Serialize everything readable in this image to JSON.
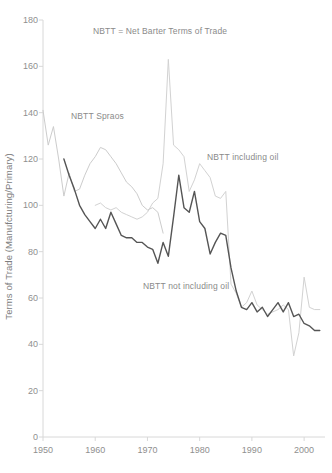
{
  "chart_data": {
    "type": "line",
    "title": "",
    "note": "NBTT = Net Barter Terms of Trade",
    "xlabel": "",
    "ylabel": "Terms of Trade (Manufcturing/Primary)",
    "xlim": [
      1950,
      2004
    ],
    "ylim": [
      0,
      180
    ],
    "grid": false,
    "legend_position": "inline-annotations",
    "y_ticks": [
      0,
      20,
      40,
      60,
      80,
      100,
      120,
      140,
      160,
      180
    ],
    "x_ticks": [
      1950,
      1960,
      1970,
      1980,
      1990,
      2000
    ],
    "y_tick_labels": [
      "0",
      "20",
      "40",
      "60",
      "80",
      "100",
      "120",
      "140",
      "160",
      "180"
    ],
    "x_tick_labels": [
      "1950",
      "1960",
      "1970",
      "1980",
      "1990",
      "2000"
    ],
    "annotations": [
      {
        "text": "NBTT = Net Barter Terms of Trade",
        "x": 1972,
        "y": 172
      },
      {
        "text": "NBTT Spraos",
        "x": 1956,
        "y": 129
      },
      {
        "text": "NBTT including oil",
        "x": 1985,
        "y": 113
      },
      {
        "text": "NBTT not including oil",
        "x": 1978,
        "y": 65
      }
    ],
    "series": [
      {
        "name": "NBTT Spraos",
        "color": "#cccccc",
        "width": 1.0,
        "x": [
          1950,
          1951,
          1952,
          1953,
          1954,
          1955,
          1956,
          1957,
          1958,
          1959,
          1960,
          1961,
          1962,
          1963,
          1964,
          1965,
          1966,
          1967,
          1968,
          1969,
          1970,
          1971,
          1972,
          1973
        ],
        "values": [
          141,
          126,
          134,
          120,
          104,
          114,
          106,
          107,
          113,
          118,
          121,
          125,
          124,
          121,
          118,
          114,
          110,
          108,
          105,
          100,
          98,
          99,
          97,
          88
        ]
      },
      {
        "name": "NBTT including oil",
        "color": "#d2d2d2",
        "width": 1.0,
        "x": [
          1960,
          1961,
          1962,
          1963,
          1964,
          1965,
          1966,
          1967,
          1968,
          1969,
          1970,
          1971,
          1972,
          1973,
          1974,
          1975,
          1976,
          1977,
          1978,
          1979,
          1980,
          1981,
          1982,
          1983,
          1984,
          1985,
          1986,
          1987,
          1988,
          1989,
          1990,
          1991,
          1992,
          1993,
          1994,
          1995,
          1996,
          1997,
          1998,
          1999,
          2000,
          2001,
          2002,
          2003
        ],
        "values": [
          100,
          101,
          99,
          98,
          99,
          97,
          96,
          95,
          94,
          95,
          97,
          101,
          103,
          118,
          163,
          126,
          124,
          121,
          106,
          111,
          118,
          115,
          112,
          104,
          103,
          106,
          66,
          62,
          56,
          58,
          63,
          57,
          55,
          53,
          54,
          55,
          57,
          55,
          35,
          45,
          69,
          56,
          55,
          55
        ]
      },
      {
        "name": "NBTT not including oil",
        "color": "#555555",
        "width": 1.4,
        "x": [
          1954,
          1955,
          1956,
          1957,
          1958,
          1959,
          1960,
          1961,
          1962,
          1963,
          1964,
          1965,
          1966,
          1967,
          1968,
          1969,
          1970,
          1971,
          1972,
          1973,
          1974,
          1975,
          1976,
          1977,
          1978,
          1979,
          1980,
          1981,
          1982,
          1983,
          1984,
          1985,
          1986,
          1987,
          1988,
          1989,
          1990,
          1991,
          1992,
          1993,
          1994,
          1995,
          1996,
          1997,
          1998,
          1999,
          2000,
          2001,
          2002,
          2003
        ],
        "values": [
          120,
          113,
          107,
          100,
          96,
          93,
          90,
          94,
          90,
          97,
          92,
          87,
          86,
          86,
          84,
          84,
          82,
          81,
          75,
          84,
          78,
          95,
          113,
          99,
          97,
          106,
          93,
          90,
          79,
          84,
          88,
          87,
          73,
          63,
          56,
          55,
          58,
          54,
          56,
          52,
          55,
          58,
          54,
          58,
          52,
          53,
          49,
          48,
          46,
          46
        ]
      }
    ]
  },
  "axes": {
    "y_title": "Terms of Trade (Manufcturing/Primary)"
  }
}
